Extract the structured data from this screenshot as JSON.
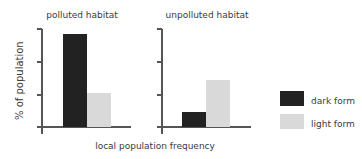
{
  "chart_data": [
    {
      "type": "bar",
      "title": "polluted habitat",
      "categories": [
        "dark form",
        "light form"
      ],
      "values": [
        95,
        35
      ],
      "ylabel": "% of population",
      "xlabel": "local population frequency",
      "ylim": [
        0,
        100
      ],
      "yticks_count": 4,
      "grid": false,
      "tick_labels_shown": false
    },
    {
      "type": "bar",
      "title": "unpolluted habitat",
      "categories": [
        "dark form",
        "light form"
      ],
      "values": [
        15,
        48
      ],
      "ylabel": "% of population",
      "xlabel": "local population frequency",
      "ylim": [
        0,
        100
      ],
      "yticks_count": 4,
      "grid": false,
      "tick_labels_shown": false
    }
  ],
  "panels": {
    "left": {
      "title": "polluted habitat"
    },
    "right": {
      "title": "unpolluted habitat"
    }
  },
  "axes": {
    "ylabel": "% of population",
    "xlabel": "local population frequency"
  },
  "legend": {
    "position": "right",
    "items": [
      {
        "label": "dark form",
        "color": "#222222"
      },
      {
        "label": "light form",
        "color": "#d9d9d9"
      }
    ]
  },
  "colors": {
    "dark": "#222222",
    "light": "#d9d9d9",
    "axis": "#555555",
    "text": "#3a3a3a"
  }
}
